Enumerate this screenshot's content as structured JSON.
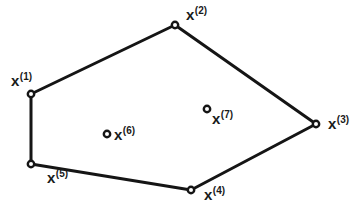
{
  "diagram": {
    "type": "convex-hull",
    "colors": {
      "line": "#151515",
      "point_fill": "#ffffff",
      "text": "#1a1a1a",
      "background": "#ffffff"
    },
    "points": [
      {
        "id": "x1",
        "base": "x",
        "sup": "(1)",
        "cx": 31,
        "cy": 94,
        "lx": 11,
        "ly": 86,
        "on_hull": true
      },
      {
        "id": "x2",
        "base": "x",
        "sup": "(2)",
        "cx": 175,
        "cy": 25,
        "lx": 186,
        "ly": 20,
        "on_hull": true
      },
      {
        "id": "x3",
        "base": "x",
        "sup": "(3)",
        "cx": 316,
        "cy": 124,
        "lx": 328,
        "ly": 129,
        "on_hull": true
      },
      {
        "id": "x4",
        "base": "x",
        "sup": "(4)",
        "cx": 191,
        "cy": 190,
        "lx": 204,
        "ly": 200,
        "on_hull": true
      },
      {
        "id": "x5",
        "base": "x",
        "sup": "(5)",
        "cx": 31,
        "cy": 164,
        "lx": 47,
        "ly": 183,
        "on_hull": true
      },
      {
        "id": "x6",
        "base": "x",
        "sup": "(6)",
        "cx": 107,
        "cy": 134,
        "lx": 114,
        "ly": 140,
        "on_hull": false
      },
      {
        "id": "x7",
        "base": "x",
        "sup": "(7)",
        "cx": 207,
        "cy": 109,
        "lx": 212,
        "ly": 124,
        "on_hull": false
      }
    ],
    "hull_order": [
      "x1",
      "x2",
      "x3",
      "x4",
      "x5"
    ]
  }
}
